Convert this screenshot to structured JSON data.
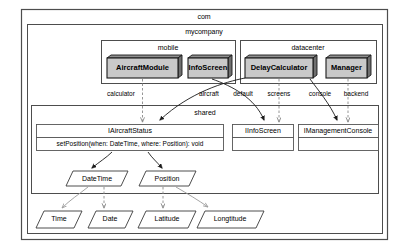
{
  "diagram": {
    "type": "uml-component-diagram",
    "packages": [
      {
        "id": "com",
        "label": "com"
      },
      {
        "id": "mycompany",
        "label": "mycompany"
      },
      {
        "id": "mobile",
        "label": "mobile"
      },
      {
        "id": "datacenter",
        "label": "datacenter"
      },
      {
        "id": "shared",
        "label": "shared"
      }
    ],
    "components": [
      {
        "id": "aircraft-module",
        "label": "AircraftModule",
        "package": "mobile"
      },
      {
        "id": "info-screen",
        "label": "InfoScreen",
        "package": "mobile"
      },
      {
        "id": "delay-calculator",
        "label": "DelayCalculator",
        "package": "datacenter"
      },
      {
        "id": "manager",
        "label": "Manager",
        "package": "datacenter"
      }
    ],
    "interfaces": [
      {
        "id": "iaircraftstatus",
        "label": "IAircraftStatus",
        "operations": [
          "setPosition(when: DateTime, where: Position): void"
        ]
      },
      {
        "id": "iinfoscreen",
        "label": "IInfoScreen",
        "operations": []
      },
      {
        "id": "imanagementconsole",
        "label": "IManagementConsole",
        "operations": []
      }
    ],
    "datatypes": [
      {
        "id": "datetime",
        "label": "DateTime"
      },
      {
        "id": "position",
        "label": "Position"
      },
      {
        "id": "time",
        "label": "Time"
      },
      {
        "id": "date",
        "label": "Date"
      },
      {
        "id": "latitude",
        "label": "Latitude"
      },
      {
        "id": "longtitude",
        "label": "Longtitude"
      }
    ],
    "edge_labels": [
      {
        "id": "calculator",
        "label": "calculator",
        "from": "aircraft-module",
        "to": "iaircraftstatus"
      },
      {
        "id": "aircraft",
        "label": "aircraft",
        "from": "delay-calculator",
        "to": "iaircraftstatus"
      },
      {
        "id": "default",
        "label": "default",
        "from": "info-screen",
        "to": "iinfoscreen"
      },
      {
        "id": "screens",
        "label": "screens",
        "from": "delay-calculator",
        "to": "iinfoscreen"
      },
      {
        "id": "console",
        "label": "console",
        "from": "manager",
        "to": "imanagementconsole"
      },
      {
        "id": "backend",
        "label": "backend",
        "from": "manager",
        "to": "imanagementconsole"
      }
    ],
    "colors": {
      "component_fill": "#c9c9c9",
      "component_shadow": "#6f6f6f",
      "package_border": "#4d4d4d",
      "interface_fill": "#ffffff",
      "dependency_dashed": "#8a8a8a",
      "dependency_solid": "#1a1a1a",
      "background": "#ffffff"
    }
  }
}
